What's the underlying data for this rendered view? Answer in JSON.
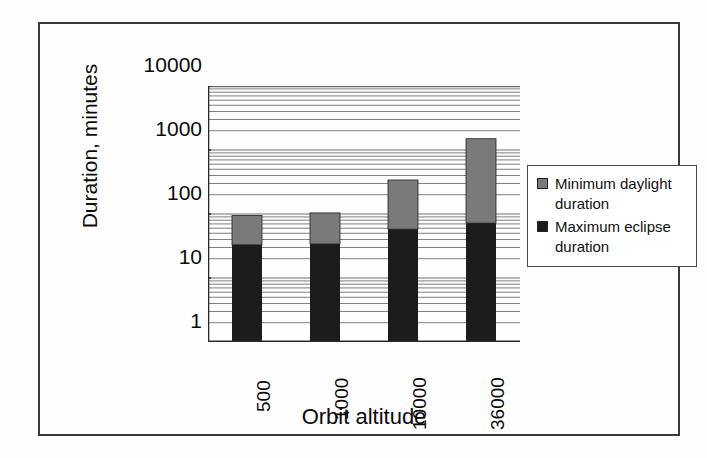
{
  "chart_data": {
    "type": "bar",
    "title": "",
    "subtitle": "",
    "stacked": true,
    "xlabel": "Orbit altitude",
    "ylabel": "Duration, minutes",
    "categories": [
      "500",
      "1000",
      "10000",
      "36000"
    ],
    "yscale": "log",
    "ylim": [
      1,
      10000
    ],
    "ytick_labels": [
      "10000",
      "1000",
      "100",
      "10",
      "1"
    ],
    "ytick_values": [
      10000,
      1000,
      100,
      10,
      1
    ],
    "grid": "horizontal-minor-log",
    "legend_position": "right",
    "series": [
      {
        "name": "Maximum eclipse duration",
        "color": "#1c1c1c",
        "values": [
          33,
          34,
          58,
          72
        ]
      },
      {
        "name": "Minimum daylight duration",
        "color": "#7a7a7a",
        "values": [
          62,
          70,
          282,
          1430
        ],
        "cumulative_tops": [
          95,
          104,
          340,
          1500
        ]
      }
    ]
  },
  "legend": {
    "items": [
      {
        "label": "Minimum daylight duration",
        "color": "#7a7a7a"
      },
      {
        "label": "Maximum eclipse duration",
        "color": "#1c1c1c"
      }
    ]
  },
  "axes": {
    "y_title": "Duration, minutes",
    "x_title": "Orbit altitude",
    "y_ticks": [
      "10000",
      "1000",
      "100",
      "10",
      "1"
    ],
    "x_ticks": [
      "500",
      "1000",
      "10000",
      "36000"
    ]
  },
  "colors": {
    "bar_dark": "#1c1c1c",
    "bar_light": "#7a7a7a",
    "gridline": "#6e6e6e",
    "axis": "#2a2a2a",
    "frame": "#3a3a3a"
  }
}
